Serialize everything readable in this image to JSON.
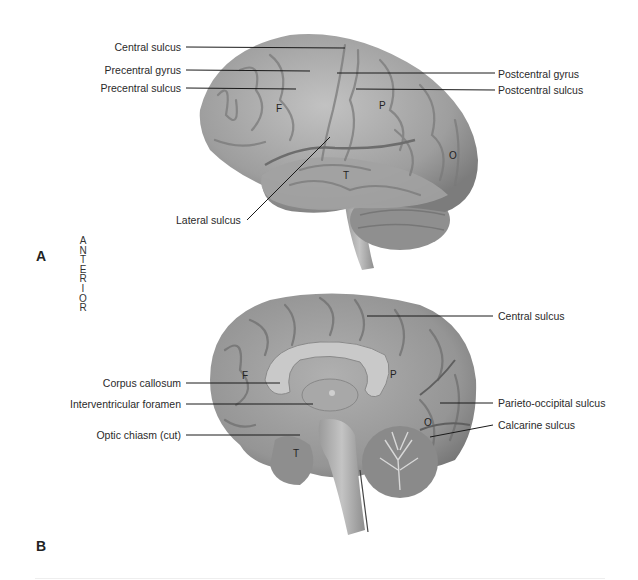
{
  "figure": {
    "panels": [
      {
        "id": "A",
        "label": "A",
        "view": "lateral",
        "left_labels": [
          "Central sulcus",
          "Precentral gyrus",
          "Precentral sulcus",
          "Lateral sulcus"
        ],
        "right_labels": [
          "Postcentral gyrus",
          "Postcentral sulcus"
        ],
        "regions": [
          "F",
          "P",
          "T",
          "O"
        ]
      },
      {
        "id": "B",
        "label": "B",
        "view": "midsagittal",
        "left_labels": [
          "Corpus callosum",
          "Interventricular foramen",
          "Optic chiasm (cut)"
        ],
        "right_labels": [
          "Central sulcus",
          "Parieto-occipital sulcus",
          "Calcarine sulcus"
        ],
        "regions": [
          "F",
          "P",
          "T",
          "O"
        ]
      }
    ],
    "orientation": {
      "word": "ANTERIOR",
      "letters": [
        "A",
        "N",
        "T",
        "E",
        "R",
        "I",
        "O",
        "R"
      ]
    },
    "colors": {
      "cortex": "#9a9a9a",
      "cortex_light": "#bdbdbd",
      "sulcus": "#6e6e6e",
      "leader_line": "#1a1a1a",
      "background": "#ffffff"
    }
  }
}
